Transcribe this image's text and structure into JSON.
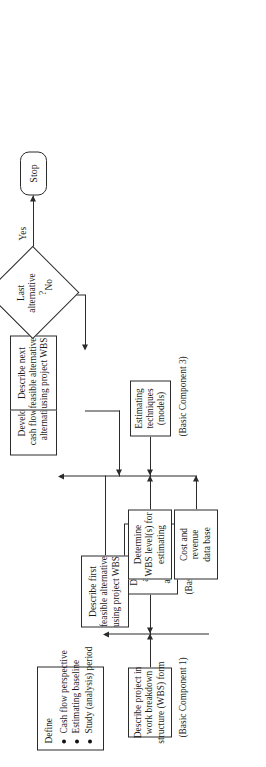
{
  "figure": {
    "orientation": "rotated-90-ccw",
    "background_color": "#ffffff",
    "line_color": "#2b2b2b",
    "nodes": {
      "describe_project_wbs": {
        "lines": [
          "Describe project in",
          "work breakdown",
          "structure (WBS) form"
        ],
        "caption": "(Basic Component 1)"
      },
      "define": {
        "title": "Define",
        "bullets": [
          "Cash flow perspective",
          "Estimating baseline",
          "Study (analysis) period"
        ]
      },
      "delineate_cost_revenue": {
        "lines": [
          "Delineate cost",
          "and revenue",
          "categories",
          "and elements"
        ],
        "caption": "(Basic Component 2)"
      },
      "describe_first_alternative": {
        "lines": [
          "Describe first",
          "feasible alternative",
          "using project WBS"
        ]
      },
      "determine_wbs_level": {
        "lines": [
          "Determine",
          "WBS level(s) for",
          "estimating"
        ]
      },
      "estimating_techniques": {
        "lines": [
          "Estimating",
          "techniques",
          "(models)"
        ],
        "caption": "(Basic Component 3)"
      },
      "cost_revenue_database": {
        "lines": [
          "Cost and",
          "revenue",
          "data base"
        ]
      },
      "develop_cash_flow": {
        "lines": [
          "Develop",
          "cash flow for",
          "alternative"
        ]
      },
      "describe_next_alternative": {
        "lines": [
          "Describe next",
          "feasible alternative",
          "using project WBS"
        ]
      },
      "last_alternative_decision": {
        "lines": [
          "Last",
          "alternative",
          "?"
        ]
      },
      "stop": {
        "label": "Stop"
      }
    },
    "edge_labels": {
      "yes": "Yes",
      "no": "No"
    }
  }
}
